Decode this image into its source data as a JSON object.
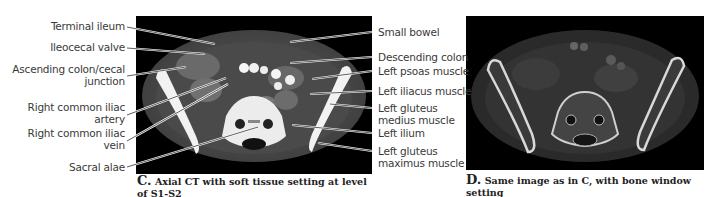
{
  "figure": {
    "panel_c": {
      "letter": "C.",
      "caption": "Axial CT with soft tissue setting at level",
      "caption_line2": "of S1-S2",
      "left_labels": [
        {
          "text": "Terminal ileum"
        },
        {
          "text": "Ileocecal valve"
        },
        {
          "text": "Ascending colon/cecal",
          "text2": "junction"
        },
        {
          "text": "Right common iliac",
          "text2": "artery"
        },
        {
          "text": "Right common iliac",
          "text2": "vein"
        },
        {
          "text": "Sacral alae"
        }
      ],
      "right_labels": [
        {
          "text": "Small bowel"
        },
        {
          "text": "Descending colon"
        },
        {
          "text": "Left psoas muscle"
        },
        {
          "text": "Left iliacus muscle"
        },
        {
          "text": "Left gluteus",
          "text2": "medius muscle"
        },
        {
          "text": "Left ilium"
        },
        {
          "text": "Left gluteus",
          "text2": "maximus muscle"
        }
      ]
    },
    "panel_d": {
      "letter": "D.",
      "caption": "Same image as in C, with bone window setting"
    }
  }
}
